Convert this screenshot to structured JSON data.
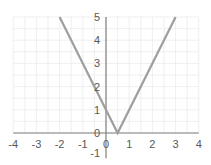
{
  "chart_data": {
    "type": "line",
    "title": "",
    "xlabel": "",
    "ylabel": "",
    "function": "y = |2x - 1|",
    "series": [
      {
        "name": "y = |2x - 1|",
        "color": "#9e9e9e",
        "x": [
          -2,
          0.5,
          3
        ],
        "y": [
          5,
          0,
          5
        ]
      }
    ],
    "xlim": [
      -4,
      4
    ],
    "ylim": [
      -1,
      5
    ],
    "x_ticks": [
      -4,
      -3,
      -2,
      -1,
      0,
      1,
      2,
      3,
      4
    ],
    "y_ticks": [
      -1,
      0,
      1,
      2,
      3,
      4,
      5
    ],
    "x_tick_labels": [
      "-4",
      "-3",
      "-2",
      "-1",
      "0",
      "1",
      "2",
      "3",
      "4"
    ],
    "y_tick_labels": [
      "-1",
      "0",
      "1",
      "2",
      "3",
      "4",
      "5"
    ],
    "grid": true,
    "legend": "none",
    "colors": {
      "axis": "#7f7f7f",
      "grid": "#ebebeb",
      "line": "#9e9e9e",
      "text": "#595959"
    }
  }
}
